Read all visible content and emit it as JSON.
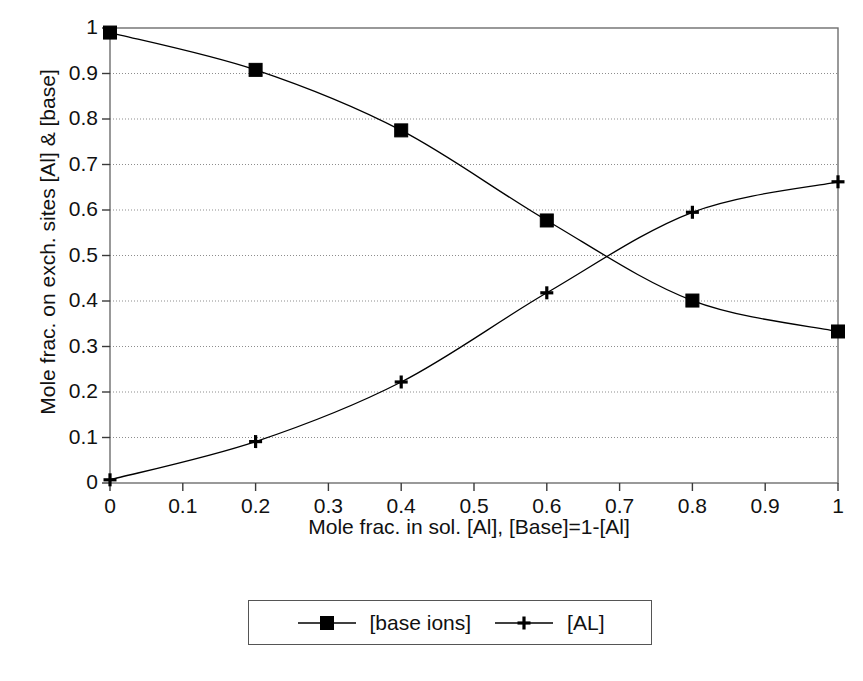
{
  "chart_data": {
    "type": "line",
    "title": "",
    "xlabel": "Mole frac. in sol. [Al], [Base]=1-[Al]",
    "ylabel": "Mole frac. on exch. sites [Al] & [base]",
    "xlim": [
      0,
      1
    ],
    "ylim": [
      0,
      1
    ],
    "xticks": [
      "0",
      "0.1",
      "0.2",
      "0.3",
      "0.4",
      "0.5",
      "0.6",
      "0.7",
      "0.8",
      "0.9",
      "1"
    ],
    "xtick_values": [
      0,
      0.1,
      0.2,
      0.3,
      0.4,
      0.5,
      0.6,
      0.7,
      0.8,
      0.9,
      1
    ],
    "yticks": [
      "0",
      "0.1",
      "0.2",
      "0.3",
      "0.4",
      "0.5",
      "0.6",
      "0.7",
      "0.8",
      "0.9",
      "1"
    ],
    "ytick_values": [
      0,
      0.1,
      0.2,
      0.3,
      0.4,
      0.5,
      0.6,
      0.7,
      0.8,
      0.9,
      1
    ],
    "grid": "horizontal-dotted",
    "legend_position": "below-plot-center",
    "x": [
      0,
      0.2,
      0.4,
      0.6,
      0.8,
      1
    ],
    "series": [
      {
        "name": "[base ions]",
        "marker": "filled-square",
        "color": "#000000",
        "values": [
          0.99,
          0.908,
          0.775,
          0.577,
          0.401,
          0.333
        ]
      },
      {
        "name": "[AL]",
        "marker": "plus",
        "color": "#000000",
        "values": [
          0.007,
          0.091,
          0.222,
          0.418,
          0.595,
          0.662
        ]
      }
    ],
    "annotations": [
      {
        "text": "curves cross near x=0.69, y=0.50"
      }
    ]
  },
  "legend": {
    "entries": [
      {
        "label": "[base ions]",
        "marker": "filled-square"
      },
      {
        "label": "[AL]",
        "marker": "plus"
      }
    ]
  },
  "axes": {
    "x_title": "Mole frac. in sol. [Al], [Base]=1-[Al]",
    "y_title": "Mole frac. on exch. sites [Al] & [base]"
  }
}
